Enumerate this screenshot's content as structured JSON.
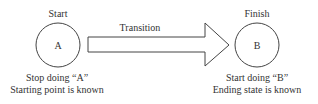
{
  "diagram": {
    "start": {
      "title": "Start",
      "node_label": "A",
      "caption_line1": "Stop doing “A”",
      "caption_line2": "Starting point is known"
    },
    "transition": {
      "label": "Transition"
    },
    "finish": {
      "title": "Finish",
      "node_label": "B",
      "caption_line1": "Start doing “B”",
      "caption_line2": "Ending state is known"
    },
    "colors": {
      "stroke": "#444444",
      "text": "#333333",
      "background": "#ffffff"
    }
  }
}
